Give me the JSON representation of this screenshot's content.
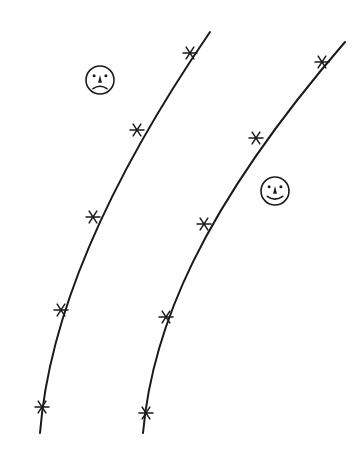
{
  "diagram": {
    "colors": {
      "background": "#ffffff",
      "ink": "#1a1a1a"
    },
    "lines": [
      {
        "id": "left-line",
        "path": "M 40 433 C 48 330, 95 200, 210 32",
        "markers": [
          {
            "x": 190,
            "y": 53
          },
          {
            "x": 137,
            "y": 130
          },
          {
            "x": 93,
            "y": 217
          },
          {
            "x": 61,
            "y": 310
          },
          {
            "x": 42,
            "y": 407
          }
        ]
      },
      {
        "id": "right-line",
        "path": "M 143 433 C 152 330, 200 210, 345 42",
        "markers": [
          {
            "x": 322,
            "y": 62
          },
          {
            "x": 256,
            "y": 138
          },
          {
            "x": 204,
            "y": 224
          },
          {
            "x": 166,
            "y": 317
          },
          {
            "x": 146,
            "y": 413
          }
        ]
      }
    ],
    "faces": [
      {
        "id": "sad-face",
        "expression": "sad",
        "cx": 100,
        "cy": 80,
        "r": 14
      },
      {
        "id": "happy-face",
        "expression": "happy",
        "cx": 275,
        "cy": 191,
        "r": 14
      }
    ]
  }
}
